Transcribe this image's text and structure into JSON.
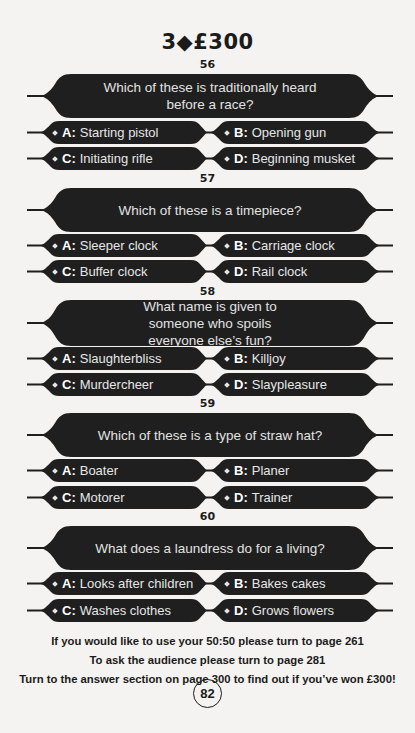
{
  "header": {
    "title": "3◆£300"
  },
  "questions": [
    {
      "number": "56",
      "text": "Which of these is traditionally heard before a race?",
      "answers": [
        {
          "letter": "A:",
          "text": "Starting pistol"
        },
        {
          "letter": "B:",
          "text": "Opening gun"
        },
        {
          "letter": "C:",
          "text": "Initiating rifle"
        },
        {
          "letter": "D:",
          "text": "Beginning musket"
        }
      ]
    },
    {
      "number": "57",
      "text": "Which of these is a timepiece?",
      "answers": [
        {
          "letter": "A:",
          "text": "Sleeper clock"
        },
        {
          "letter": "B:",
          "text": "Carriage clock"
        },
        {
          "letter": "C:",
          "text": "Buffer clock"
        },
        {
          "letter": "D:",
          "text": "Rail clock"
        }
      ]
    },
    {
      "number": "58",
      "text": "What name is given to someone who spoils everyone else’s fun?",
      "answers": [
        {
          "letter": "A:",
          "text": "Slaughterbliss"
        },
        {
          "letter": "B:",
          "text": "Killjoy"
        },
        {
          "letter": "C:",
          "text": "Murdercheer"
        },
        {
          "letter": "D:",
          "text": "Slaypleasure"
        }
      ]
    },
    {
      "number": "59",
      "text": "Which of these is a type of straw hat?",
      "answers": [
        {
          "letter": "A:",
          "text": "Boater"
        },
        {
          "letter": "B:",
          "text": "Planer"
        },
        {
          "letter": "C:",
          "text": "Motorer"
        },
        {
          "letter": "D:",
          "text": "Trainer"
        }
      ]
    },
    {
      "number": "60",
      "text": "What does a laundress do for a living?",
      "answers": [
        {
          "letter": "A:",
          "text": "Looks after children"
        },
        {
          "letter": "B:",
          "text": "Bakes cakes"
        },
        {
          "letter": "C:",
          "text": "Washes clothes"
        },
        {
          "letter": "D:",
          "text": "Grows flowers"
        }
      ]
    }
  ],
  "footer": {
    "line1": "If you would like to use your 50:50 please turn to page 261",
    "line2": "To ask the audience please turn to page 281",
    "line3": "Turn to the answer section on page 300 to find out if you’ve won £300!"
  },
  "page_number": "82",
  "colors": {
    "banner": "#1f1f1f",
    "page_bg": "#f4f3f1",
    "banner_text": "#e2e2e2"
  }
}
